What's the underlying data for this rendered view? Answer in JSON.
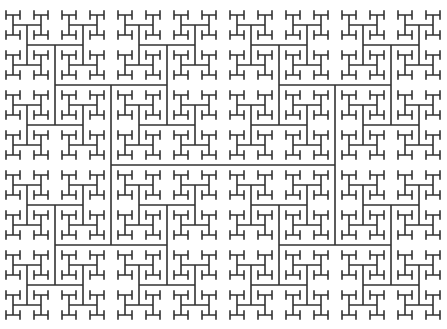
{
  "diagram": {
    "type": "h-tree-fractal",
    "width": 447,
    "height": 329,
    "background": "#ffffff",
    "stroke_color": "#333333",
    "stroke_width": 1.6,
    "center": [
      223,
      165
    ],
    "segment_lengths": [
      224,
      160,
      112,
      80,
      56,
      40,
      28,
      20,
      14,
      8
    ],
    "first_orientation": "horizontal"
  }
}
